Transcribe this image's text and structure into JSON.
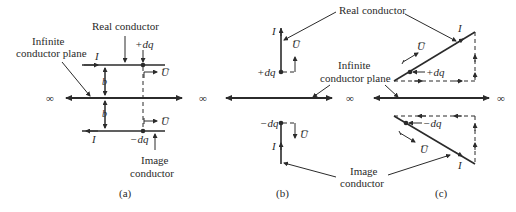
{
  "figure": {
    "panels": [
      {
        "id": "a",
        "caption": "(a)",
        "labels": {
          "real_conductor": "Real conductor",
          "infinite_plane_line1": "Infinite",
          "infinite_plane_line2": "conductor plane",
          "image_line1": "Image",
          "image_line2": "conductor",
          "current_top": "I",
          "current_bottom": "I",
          "charge_pos": "+dq",
          "charge_neg": "−dq",
          "velocity_top": "U̅",
          "velocity_bottom": "U̅",
          "distance_top": "b",
          "distance_bottom": "b",
          "infinity": "∞"
        }
      },
      {
        "id": "b",
        "caption": "(b)",
        "labels": {
          "current_top": "I",
          "current_bottom": "I",
          "charge_pos": "+dq",
          "charge_neg": "−dq",
          "velocity_top": "U̅",
          "velocity_bottom": "U̅",
          "infinity_left": "∞",
          "infinity_right": "∞"
        }
      },
      {
        "id": "c",
        "caption": "(c)",
        "labels": {
          "current_top": "I",
          "current_bottom": "I",
          "charge_pos": "+dq",
          "charge_neg": "−dq",
          "velocity_top": "U̅",
          "velocity_bottom": "U̅",
          "infinity_right": "∞"
        }
      }
    ],
    "shared_labels": {
      "real_conductor": "Real conductor",
      "infinite_plane_line1": "Infinite",
      "infinite_plane_line2": "conductor plane",
      "image_line1": "Image",
      "image_line2": "conductor"
    },
    "colors": {
      "ink": "#2b2b2b",
      "background": "#ffffff"
    }
  }
}
